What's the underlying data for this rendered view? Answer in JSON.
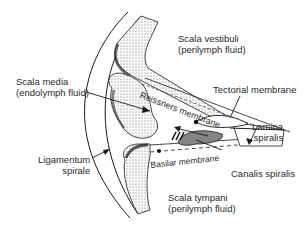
{
  "diagram": {
    "labels": {
      "scala_vestibuli": {
        "line1": "Scala vestibuli",
        "line2": "(perilymph fluid)"
      },
      "scala_media": {
        "line1": "Scala media",
        "line2": "(endolymph fluid)"
      },
      "tectorial_membrane": {
        "text": "Tectorial membrane"
      },
      "reissners_membrane": {
        "text": "Reissners membrane"
      },
      "lamina_spiralis": {
        "line1": "Lamina",
        "line2": "spiralis"
      },
      "ligamentum_spirale": {
        "line1": "Ligamentum",
        "line2": "spirale"
      },
      "canalis_spiralis": {
        "text": "Canalis spiralis"
      },
      "basilar_membrane": {
        "text": "Basilar membrane"
      },
      "scala_tympani": {
        "line1": "Scala tympani",
        "line2": "(perilymph fluid)"
      }
    },
    "colors": {
      "ink": "#1a1a1a",
      "text": "#2a2a2a",
      "background": "#ffffff"
    }
  }
}
